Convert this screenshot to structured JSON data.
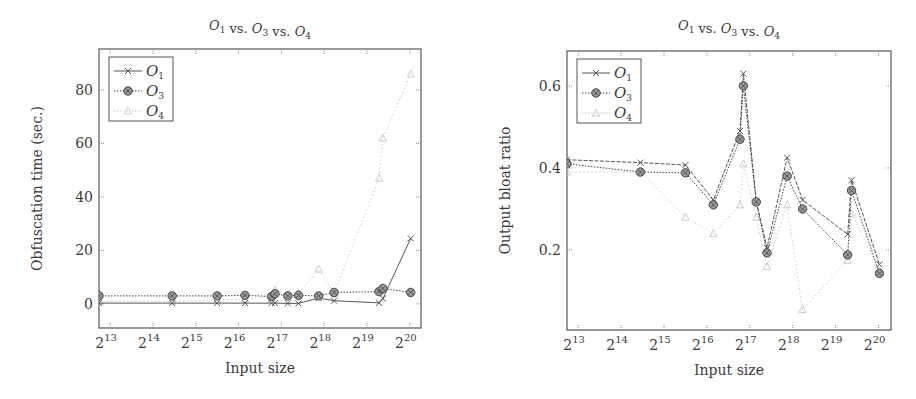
{
  "chart_data": [
    {
      "type": "line",
      "title": "O1 vs. O3 vs. O4",
      "xlabel": "Input size",
      "ylabel": "Obfuscation time (sec.)",
      "xscale": "log2",
      "x_tick_labels": [
        "2^13",
        "2^14",
        "2^15",
        "2^16",
        "2^17",
        "2^18",
        "2^19",
        "2^20"
      ],
      "x_log2_range": [
        12.74,
        20.26
      ],
      "y_ticks": [
        0,
        20,
        40,
        60,
        80
      ],
      "ylim": [
        -9,
        95.3
      ],
      "grid": false,
      "legend_position": "upper left",
      "series": [
        {
          "name": "O1",
          "marker": "x",
          "line": "solid",
          "color": "#555555",
          "x_log2": [
            12.74,
            14.45,
            15.5,
            16.15,
            16.77,
            16.85,
            17.15,
            17.4,
            17.87,
            18.23,
            19.28,
            19.37,
            20.02
          ],
          "values": [
            0.3,
            0.3,
            0.3,
            0.3,
            0.3,
            0.3,
            0.2,
            0.2,
            2.2,
            1.2,
            0.4,
            2.0,
            24.5
          ]
        },
        {
          "name": "O3",
          "marker": "circle-x",
          "line": "dotted",
          "color": "#444444",
          "x_log2": [
            12.74,
            14.45,
            15.5,
            16.15,
            16.77,
            16.85,
            17.15,
            17.4,
            17.87,
            18.23,
            19.28,
            19.37,
            20.02
          ],
          "values": [
            3.0,
            3.0,
            3.0,
            3.2,
            2.8,
            3.8,
            3.0,
            3.2,
            3.0,
            4.3,
            4.6,
            5.8,
            4.3
          ]
        },
        {
          "name": "O4",
          "marker": "triangle",
          "line": "dotted",
          "color": "#cccccc",
          "x_log2": [
            12.74,
            14.45,
            15.5,
            16.15,
            16.77,
            16.85,
            17.15,
            17.4,
            17.87,
            18.23,
            19.28,
            19.37,
            20.02
          ],
          "values": [
            1.0,
            1.0,
            1.5,
            1.8,
            3.0,
            5.0,
            3.5,
            4.0,
            13.0,
            4.0,
            47.0,
            62.0,
            86.0
          ]
        }
      ]
    },
    {
      "type": "line",
      "title": "O1 vs. O3 vs. O4",
      "xlabel": "Input size",
      "ylabel": "Output bloat ratio",
      "xscale": "log2",
      "x_tick_labels": [
        "2^13",
        "2^14",
        "2^15",
        "2^16",
        "2^17",
        "2^18",
        "2^19",
        "2^20"
      ],
      "x_log2_range": [
        12.74,
        20.29
      ],
      "y_ticks": [
        0.2,
        0.4,
        0.6
      ],
      "ylim": [
        0.005,
        0.685
      ],
      "grid": false,
      "legend_position": "upper left",
      "series": [
        {
          "name": "O1",
          "marker": "x",
          "line": "solid",
          "color": "#555555",
          "x_log2": [
            12.74,
            14.45,
            15.5,
            16.15,
            16.77,
            16.85,
            17.15,
            17.4,
            17.87,
            18.23,
            19.28,
            19.37,
            20.02
          ],
          "values": [
            0.42,
            0.413,
            0.407,
            0.322,
            0.49,
            0.63,
            0.32,
            0.205,
            0.425,
            0.322,
            0.238,
            0.37,
            0.165
          ]
        },
        {
          "name": "O3",
          "marker": "circle-x",
          "line": "dotted",
          "color": "#444444",
          "x_log2": [
            12.74,
            14.45,
            15.5,
            16.15,
            16.77,
            16.85,
            17.15,
            17.4,
            17.87,
            18.23,
            19.28,
            19.37,
            20.02
          ],
          "values": [
            0.41,
            0.39,
            0.388,
            0.31,
            0.47,
            0.6,
            0.317,
            0.193,
            0.38,
            0.3,
            0.188,
            0.345,
            0.143
          ]
        },
        {
          "name": "O4",
          "marker": "triangle",
          "line": "dotted",
          "color": "#cccccc",
          "x_log2": [
            12.74,
            14.45,
            15.5,
            16.15,
            16.77,
            16.85,
            17.15,
            17.4,
            17.87,
            18.23,
            19.28,
            19.37,
            20.02
          ],
          "values": [
            0.39,
            0.39,
            0.28,
            0.24,
            0.31,
            0.41,
            0.28,
            0.16,
            0.31,
            0.055,
            0.175,
            0.29,
            0.15
          ]
        }
      ]
    }
  ]
}
